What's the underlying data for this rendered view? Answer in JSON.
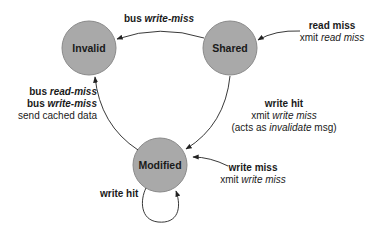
{
  "diagram": {
    "colors": {
      "state_fill": "#a9a9a9",
      "state_stroke": "#8a8a8a",
      "edge": "#222222",
      "text": "#1a1a1a"
    },
    "states": [
      {
        "id": "invalid",
        "label": "Invalid",
        "cx": 89,
        "cy": 48,
        "r": 27
      },
      {
        "id": "shared",
        "label": "Shared",
        "cx": 230,
        "cy": 48,
        "r": 27
      },
      {
        "id": "modified",
        "label": "Modified",
        "cx": 160,
        "cy": 165,
        "r": 27
      }
    ],
    "transitions": {
      "shared_to_invalid": {
        "line1_pre": "bus ",
        "line1_em": "write-miss"
      },
      "external_to_shared": {
        "line1": "read miss",
        "line2_pre": "xmit ",
        "line2_em": "read miss"
      },
      "modified_to_invalid": {
        "line1_pre": "bus ",
        "line1_em": "read-miss",
        "line2_pre": "bus ",
        "line2_em": "write-miss",
        "line3": "send cached data"
      },
      "shared_to_modified": {
        "line1": "write hit",
        "line2_pre": "xmit ",
        "line2_em": "write miss",
        "line3_pre": "(acts as ",
        "line3_em": "invalidate",
        "line3_post": " msg)"
      },
      "external_to_modified": {
        "line1": "write miss",
        "line2_pre": "xmit ",
        "line2_em": "write miss"
      },
      "modified_self_loop": {
        "line1": "write hit"
      }
    }
  }
}
